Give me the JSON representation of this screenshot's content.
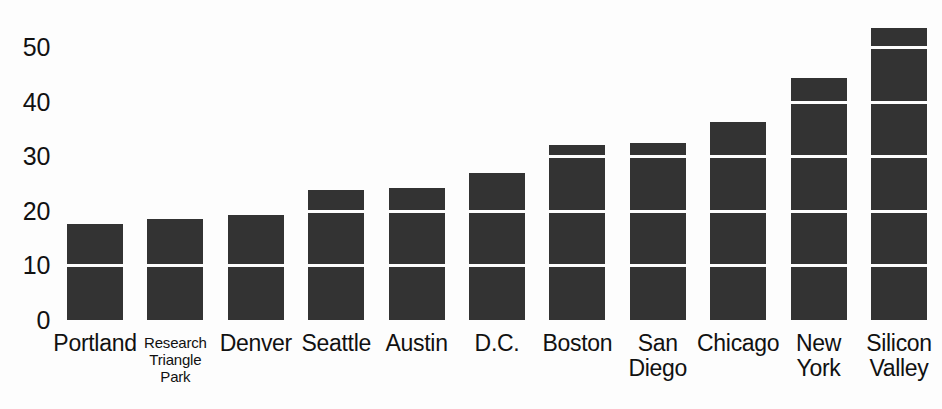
{
  "chart_data": {
    "type": "bar",
    "title": "",
    "subtitle": "",
    "xlabel": "",
    "ylabel": "",
    "categories": [
      "Portland",
      "Research Triangle Park",
      "Denver",
      "Seattle",
      "Austin",
      "D.C.",
      "Boston",
      "San Diego",
      "Chicago",
      "New York",
      "Silicon Valley"
    ],
    "category_lines": [
      [
        "Portland"
      ],
      [
        "Research",
        "Triangle",
        "Park"
      ],
      [
        "Denver"
      ],
      [
        "Seattle"
      ],
      [
        "Austin"
      ],
      [
        "D.C."
      ],
      [
        "Boston"
      ],
      [
        "San",
        "Diego"
      ],
      [
        "Chicago"
      ],
      [
        "New",
        "York"
      ],
      [
        "Silicon",
        "Valley"
      ]
    ],
    "values": [
      17.5,
      18.5,
      19.2,
      23.8,
      24.2,
      27.0,
      32.0,
      32.4,
      36.3,
      44.3,
      53.5
    ],
    "ylim": [
      0,
      55
    ],
    "yticks": [
      0,
      10,
      20,
      30,
      40,
      50
    ],
    "ytick_labels": [
      "0",
      "10",
      "20",
      "30",
      "40",
      "50"
    ],
    "grid": true,
    "grid_axis": "y",
    "gridline_color": "#fdfdfd",
    "bar_color": "#333333",
    "background_color": "#fdfdfd",
    "legend": null,
    "legend_position": "none",
    "annotations": []
  },
  "artifacts": {
    "top_clipped_text": ""
  }
}
